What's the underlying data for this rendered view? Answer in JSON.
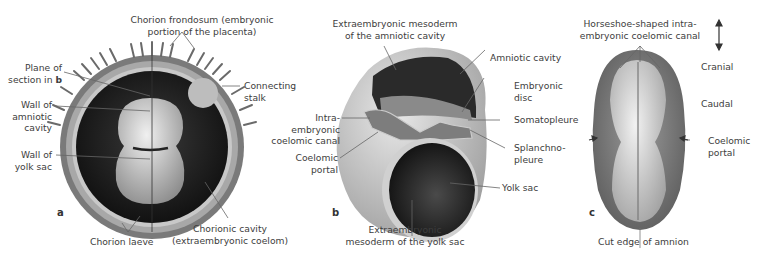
{
  "figure": {
    "panels": [
      {
        "id": "a",
        "label": "a",
        "annotations": {
          "chorion_frondosum_1": "Chorion frondosum (embryonic",
          "chorion_frondosum_2": "portion of the placenta)",
          "plane_1": "Plane of",
          "plane_2": "section in ",
          "plane_bold": "b",
          "connecting_1": "Connecting",
          "connecting_2": "stalk",
          "amniotic_wall_1": "Wall of",
          "amniotic_wall_2": "amniotic",
          "amniotic_wall_3": "cavity",
          "yolk_wall_1": "Wall of",
          "yolk_wall_2": "yolk sac",
          "chorion_laeve": "Chorion laeve",
          "chorionic_cavity_1": "Chorionic cavity",
          "chorionic_cavity_2": "(extraembryonic coelom)"
        }
      },
      {
        "id": "b",
        "label": "b",
        "annotations": {
          "extra_meso_amn_1": "Extraembryonic mesoderm",
          "extra_meso_amn_2": "of the amniotic cavity",
          "amniotic_cavity": "Amniotic cavity",
          "embryonic_disc_1": "Embryonic",
          "embryonic_disc_2": "disc",
          "somatopleure": "Somatopleure",
          "splanchno_1": "Splanchno-",
          "splanchno_2": "pleure",
          "yolk_sac": "Yolk sac",
          "intra_1": "Intra-",
          "intra_2": "embryonic",
          "intra_3": "coelomic canal",
          "coelomic_portal_1": "Coelomic",
          "coelomic_portal_2": "portal",
          "extra_meso_yolk_1": "Extraembryonic",
          "extra_meso_yolk_2": "mesoderm of the yolk sac"
        }
      },
      {
        "id": "c",
        "label": "c",
        "annotations": {
          "horseshoe_1": "Horseshoe-shaped intra-",
          "horseshoe_2": "embryonic coelomic canal",
          "cranial": "Cranial",
          "caudal": "Caudal",
          "coelomic_portal_1": "Coelomic",
          "coelomic_portal_2": "portal",
          "cut_edge": "Cut edge of amnion"
        }
      }
    ],
    "colors": {
      "text": "#3d3d3d",
      "leader_line": "#555555",
      "chorion": "#9a9a9a",
      "cavity": "#1a1a1a",
      "tissue_light": "#d8d8d8"
    }
  }
}
